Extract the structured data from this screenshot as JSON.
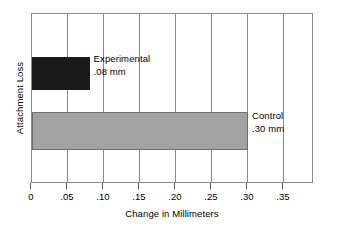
{
  "chart_data": {
    "type": "bar",
    "orientation": "horizontal",
    "title": "",
    "xlabel": "Change in Millimeters",
    "ylabel": "Attachment Loss",
    "xlim": [
      0,
      0.3917
    ],
    "grid": true,
    "legend_position": "inline-annotation",
    "categories": [
      "Experimental",
      "Control"
    ],
    "values": [
      0.08,
      0.3
    ],
    "bars": [
      {
        "category": "Experimental",
        "value": 0.08,
        "label_name": "Experimental",
        "label_value": ".08 mm",
        "color": "#1a1a1a"
      },
      {
        "category": "Control",
        "value": 0.3,
        "label_name": "Control",
        "label_value": ".30 mm",
        "color": "#a3a3a3"
      }
    ],
    "x_ticks": [
      {
        "value": 0,
        "label": "0"
      },
      {
        "value": 0.05,
        "label": ".05"
      },
      {
        "value": 0.1,
        "label": ".10"
      },
      {
        "value": 0.15,
        "label": ".15"
      },
      {
        "value": 0.2,
        "label": ".20"
      },
      {
        "value": 0.25,
        "label": ".25"
      },
      {
        "value": 0.3,
        "label": ".30"
      },
      {
        "value": 0.35,
        "label": ".35"
      }
    ],
    "colors": {
      "experimental_bar": "#1a1a1a",
      "control_bar": "#a3a3a3",
      "axis": "#8a8a8a",
      "text": "#000000",
      "background": "#ffffff"
    }
  }
}
